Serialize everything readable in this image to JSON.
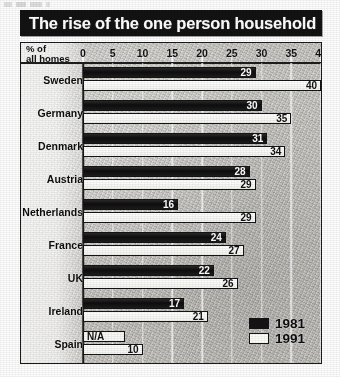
{
  "title": "The rise of the one person household",
  "chart_data": {
    "type": "bar",
    "orientation": "horizontal",
    "title": "The rise of the one person household",
    "xlabel": "% of all homes",
    "ylabel": "",
    "xlim": [
      0,
      40
    ],
    "xticks": [
      0,
      5,
      10,
      15,
      20,
      25,
      30,
      35,
      40
    ],
    "tick_labels": [
      "0",
      "5",
      "10",
      "15",
      "20",
      "25",
      "30",
      "35",
      "40"
    ],
    "grid": true,
    "legend_position": "bottom-right",
    "categories": [
      "Sweden",
      "Germany",
      "Denmark",
      "Austria",
      "Netherlands",
      "France",
      "UK",
      "Ireland",
      "Spain"
    ],
    "series": [
      {
        "name": "1981",
        "color": "#141414",
        "values": [
          29,
          30,
          31,
          28,
          16,
          24,
          22,
          17,
          null
        ],
        "labels": [
          "29",
          "30",
          "31",
          "28",
          "16",
          "24",
          "22",
          "17",
          "N/A"
        ]
      },
      {
        "name": "1991",
        "color": "#fbfbf8",
        "values": [
          40,
          35,
          34,
          29,
          29,
          27,
          26,
          21,
          10
        ],
        "labels": [
          "40",
          "35",
          "34",
          "29",
          "29",
          "27",
          "26",
          "21",
          "10"
        ]
      }
    ]
  },
  "legend": [
    {
      "label": "1981",
      "swatch": "filled-black-square"
    },
    {
      "label": "1991",
      "swatch": "open-white-square"
    }
  ],
  "colors": {
    "series_1981": "#141414",
    "series_1991": "#fbfbf8",
    "banner_bg": "#121212",
    "banner_text": "#ffffff",
    "plot_bg": "#cfcdc8",
    "frame": "#1a1a1a"
  }
}
